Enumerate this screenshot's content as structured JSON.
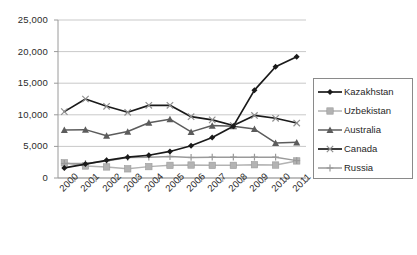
{
  "chart_data": {
    "type": "line",
    "title": "",
    "subtitle": "",
    "xlabel": "",
    "ylabel": "",
    "categories": [
      "2000",
      "2001",
      "2002",
      "2003",
      "2004",
      "2005",
      "2006",
      "2007",
      "2008",
      "2009",
      "2010",
      "2011"
    ],
    "ylim": [
      0,
      25000
    ],
    "y_ticks": [
      0,
      5000,
      10000,
      15000,
      20000,
      25000
    ],
    "y_tick_labels": [
      "0",
      "5,000",
      "10,000",
      "15,000",
      "20,000",
      "25,000"
    ],
    "grid": true,
    "legend_position": "right",
    "series": [
      {
        "name": "Kazakhstan",
        "marker": "diamond",
        "color": "#1a1a1a",
        "values": [
          1600,
          2200,
          2800,
          3300,
          3600,
          4200,
          5100,
          6400,
          8200,
          13900,
          17600,
          19200
        ]
      },
      {
        "name": "Uzbekistan",
        "marker": "square",
        "color": "#b3b3b3",
        "values": [
          2400,
          1900,
          1750,
          1450,
          1800,
          2000,
          2050,
          2000,
          2000,
          2100,
          2050,
          2700
        ]
      },
      {
        "name": "Australia",
        "marker": "triangle",
        "color": "#5c5c5c",
        "values": [
          7600,
          7650,
          6700,
          7350,
          8750,
          9300,
          7300,
          8300,
          8200,
          7750,
          5550,
          5650
        ]
      },
      {
        "name": "Canada",
        "marker": "cross",
        "color": "#1a1a1a",
        "values": [
          10500,
          12500,
          11350,
          10400,
          11500,
          11500,
          9700,
          9200,
          8300,
          9900,
          9450,
          8700
        ]
      },
      {
        "name": "Russia",
        "marker": "plus",
        "color": "#9a9a9a",
        "values": [
          2300,
          2300,
          2700,
          3250,
          3300,
          3400,
          3250,
          3300,
          3300,
          3300,
          3300,
          2750
        ]
      }
    ]
  },
  "legend": {
    "items": [
      {
        "label": "Kazakhstan"
      },
      {
        "label": "Uzbekistan"
      },
      {
        "label": "Australia"
      },
      {
        "label": "Canada"
      },
      {
        "label": "Russia"
      }
    ]
  }
}
